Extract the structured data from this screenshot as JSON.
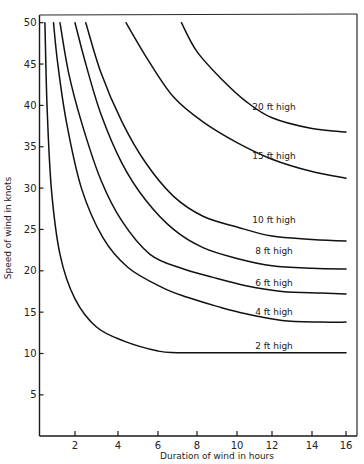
{
  "chart_data": {
    "type": "line",
    "title": "",
    "xlabel": "Duration of wind in hours",
    "ylabel": "Speed of wind in knots",
    "xlim": [
      0.3,
      16.5
    ],
    "ylim": [
      0,
      50
    ],
    "grid": false,
    "legend": "inline curve labels",
    "x_ticks": [
      2,
      4,
      6,
      8,
      10,
      12,
      14,
      16
    ],
    "x_tick_labels": [
      "2",
      "4",
      "6",
      "8",
      "10",
      "12",
      "14",
      "16"
    ],
    "y_ticks": [
      5,
      10,
      15,
      20,
      25,
      30,
      35,
      40,
      45,
      50
    ],
    "y_tick_labels": [
      "5",
      "10",
      "15",
      "20",
      "25",
      "30",
      "35",
      "40",
      "45",
      "50"
    ],
    "series": [
      {
        "name": "2 ft high",
        "label": "2 ft high",
        "x": [
          0.6,
          0.7,
          0.9,
          1.3,
          2.0,
          3.0,
          4.3,
          6.0,
          7.0,
          10.0,
          13.0,
          16.0
        ],
        "y": [
          50.0,
          40.0,
          30.0,
          22.0,
          16.6,
          13.2,
          11.5,
          10.3,
          10.1,
          10.1,
          10.1,
          10.1
        ]
      },
      {
        "name": "4 ft high",
        "label": "4 ft high",
        "x": [
          1.0,
          1.2,
          1.6,
          2.3,
          3.3,
          4.5,
          6.2,
          7.5,
          9.0,
          10.5,
          12.5,
          14.5,
          16.0
        ],
        "y": [
          50.0,
          45.0,
          38.0,
          30.0,
          24.0,
          20.4,
          18.0,
          16.8,
          15.7,
          14.8,
          14.0,
          13.8,
          13.8
        ]
      },
      {
        "name": "6 ft high",
        "label": "6 ft high",
        "x": [
          1.3,
          1.7,
          2.3,
          3.2,
          4.2,
          5.6,
          7.2,
          8.8,
          10.5,
          12.5,
          14.5,
          16.0
        ],
        "y": [
          50.0,
          44.0,
          38.0,
          31.0,
          26.0,
          22.0,
          20.3,
          19.2,
          18.2,
          17.5,
          17.3,
          17.2
        ]
      },
      {
        "name": "8 ft high",
        "label": "8 ft high",
        "x": [
          2.0,
          2.5,
          3.2,
          4.2,
          5.4,
          6.8,
          8.3,
          10.0,
          12.0,
          14.0,
          16.0
        ],
        "y": [
          50.0,
          45.0,
          39.0,
          33.0,
          28.5,
          25.0,
          22.8,
          21.5,
          20.6,
          20.3,
          20.2
        ]
      },
      {
        "name": "10 ft high",
        "label": "10 ft high",
        "x": [
          2.5,
          3.2,
          4.2,
          5.4,
          6.8,
          8.3,
          10.0,
          12.0,
          14.0,
          16.0
        ],
        "y": [
          50.0,
          44.0,
          38.0,
          33.0,
          29.0,
          26.6,
          25.3,
          24.2,
          23.8,
          23.6
        ]
      },
      {
        "name": "15 ft high",
        "label": "15 ft high",
        "x": [
          4.4,
          5.5,
          6.8,
          8.3,
          10.0,
          12.0,
          14.0,
          16.0
        ],
        "y": [
          50.0,
          45.5,
          41.0,
          38.0,
          35.5,
          33.5,
          32.0,
          31.2
        ]
      },
      {
        "name": "20 ft high",
        "label": "20 ft high",
        "x": [
          7.2,
          8.0,
          9.3,
          10.5,
          12.0,
          14.0,
          16.0
        ],
        "y": [
          50.0,
          46.5,
          43.0,
          40.5,
          38.5,
          37.2,
          36.8
        ]
      }
    ],
    "annotations": [
      {
        "text": "20 ft high",
        "x": 12.0,
        "y": 39.5
      },
      {
        "text": "15 ft high",
        "x": 12.0,
        "y": 33.5
      },
      {
        "text": "10 ft high",
        "x": 12.0,
        "y": 25.8
      },
      {
        "text": "8 ft high",
        "x": 12.0,
        "y": 22.0
      },
      {
        "text": "6 ft high",
        "x": 12.0,
        "y": 18.2
      },
      {
        "text": "4 ft high",
        "x": 12.0,
        "y": 14.6
      },
      {
        "text": "2 ft high",
        "x": 12.0,
        "y": 10.5
      }
    ]
  },
  "layout": {
    "plot_left": 39.5,
    "plot_right": 357,
    "plot_top": 15,
    "plot_bottom": 436,
    "x_tick_px": {
      "2": 75,
      "4": 118,
      "6": 158,
      "8": 197,
      "10": 237,
      "12": 272,
      "14": 312,
      "16": 346
    },
    "y_zero_px": 436,
    "y_px_per_unit": 8.27,
    "y_50_px": 22.7
  }
}
